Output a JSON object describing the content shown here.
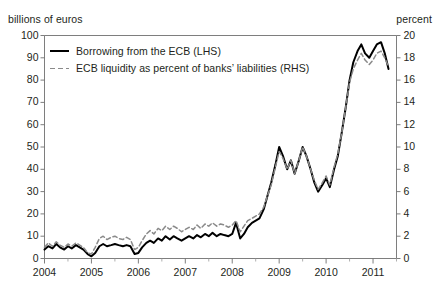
{
  "figure": {
    "clipped_title_fragment": "",
    "left_axis_unit": "billions of euros",
    "right_axis_unit": "percent"
  },
  "legend": {
    "items": [
      {
        "label": "Borrowing from the ECB (LHS)",
        "style": "solid",
        "color": "#000000"
      },
      {
        "label": "ECB liquidity as percent of banks’ liabilities (RHS)",
        "style": "dashed",
        "color": "#8a8a8a"
      }
    ]
  },
  "chart_data": {
    "type": "line",
    "title": "",
    "xlabel": "",
    "ylabel": "billions of euros",
    "y2label": "percent",
    "grid": false,
    "legend_position": "top-left inside",
    "xlim": [
      2004.0,
      2011.5
    ],
    "ylim": [
      0,
      100
    ],
    "y2lim": [
      0,
      20
    ],
    "yticks": [
      0,
      10,
      20,
      30,
      40,
      50,
      60,
      70,
      80,
      90,
      100
    ],
    "y2ticks": [
      0,
      2,
      4,
      6,
      8,
      10,
      12,
      14,
      16,
      18,
      20
    ],
    "xticks": [
      2004,
      2005,
      2006,
      2007,
      2008,
      2009,
      2010,
      2011
    ],
    "xtick_labels": [
      "2004",
      "2005",
      "2006",
      "2007",
      "2008",
      "2009",
      "2010",
      "2011"
    ],
    "x_minor_ticks_per_year": 2,
    "series": [
      {
        "name": "Borrowing from the ECB (LHS)",
        "axis": "left",
        "style": "solid",
        "color": "#000000",
        "x": [
          2004.0,
          2004.08,
          2004.17,
          2004.25,
          2004.33,
          2004.42,
          2004.5,
          2004.58,
          2004.67,
          2004.75,
          2004.83,
          2004.92,
          2005.0,
          2005.08,
          2005.17,
          2005.25,
          2005.33,
          2005.42,
          2005.5,
          2005.58,
          2005.67,
          2005.75,
          2005.83,
          2005.92,
          2006.0,
          2006.08,
          2006.17,
          2006.25,
          2006.33,
          2006.42,
          2006.5,
          2006.58,
          2006.67,
          2006.75,
          2006.83,
          2006.92,
          2007.0,
          2007.08,
          2007.17,
          2007.25,
          2007.33,
          2007.42,
          2007.5,
          2007.58,
          2007.67,
          2007.75,
          2007.83,
          2007.92,
          2008.0,
          2008.08,
          2008.17,
          2008.25,
          2008.33,
          2008.42,
          2008.5,
          2008.58,
          2008.67,
          2008.75,
          2008.83,
          2008.92,
          2009.0,
          2009.08,
          2009.17,
          2009.25,
          2009.33,
          2009.42,
          2009.5,
          2009.58,
          2009.67,
          2009.75,
          2009.83,
          2009.92,
          2010.0,
          2010.08,
          2010.17,
          2010.25,
          2010.33,
          2010.42,
          2010.5,
          2010.58,
          2010.67,
          2010.75,
          2010.83,
          2010.92,
          2011.0,
          2011.08,
          2011.17,
          2011.25,
          2011.33
        ],
        "values": [
          4.0,
          5.5,
          4.5,
          6.5,
          5.0,
          4.0,
          5.5,
          4.5,
          6.0,
          5.0,
          4.0,
          2.0,
          1.0,
          2.5,
          5.5,
          6.5,
          5.5,
          6.0,
          6.5,
          6.0,
          5.5,
          6.0,
          5.5,
          2.0,
          2.5,
          5.0,
          7.0,
          8.0,
          7.0,
          9.0,
          8.0,
          10.0,
          8.5,
          10.0,
          9.0,
          8.0,
          9.0,
          10.0,
          9.0,
          10.5,
          9.5,
          11.0,
          10.0,
          11.5,
          10.0,
          11.0,
          10.5,
          10.0,
          11.0,
          16.0,
          9.0,
          11.0,
          14.0,
          16.0,
          17.0,
          18.0,
          22.0,
          28.0,
          34.0,
          42.0,
          50.0,
          46.0,
          40.0,
          44.0,
          38.0,
          44.0,
          50.0,
          46.0,
          40.0,
          34.0,
          30.0,
          33.0,
          36.0,
          32.0,
          40.0,
          46.0,
          56.0,
          68.0,
          80.0,
          88.0,
          93.0,
          96.0,
          92.0,
          90.0,
          93.0,
          96.0,
          97.0,
          92.0,
          85.0
        ]
      },
      {
        "name": "ECB liquidity as percent of banks’ liabilities (RHS)",
        "axis": "right",
        "style": "dashed",
        "color": "#8a8a8a",
        "x": [
          2004.0,
          2004.08,
          2004.17,
          2004.25,
          2004.33,
          2004.42,
          2004.5,
          2004.58,
          2004.67,
          2004.75,
          2004.83,
          2004.92,
          2005.0,
          2005.08,
          2005.17,
          2005.25,
          2005.33,
          2005.42,
          2005.5,
          2005.58,
          2005.67,
          2005.75,
          2005.83,
          2005.92,
          2006.0,
          2006.08,
          2006.17,
          2006.25,
          2006.33,
          2006.42,
          2006.5,
          2006.58,
          2006.67,
          2006.75,
          2006.83,
          2006.92,
          2007.0,
          2007.08,
          2007.17,
          2007.25,
          2007.33,
          2007.42,
          2007.5,
          2007.58,
          2007.67,
          2007.75,
          2007.83,
          2007.92,
          2008.0,
          2008.08,
          2008.17,
          2008.25,
          2008.33,
          2008.42,
          2008.5,
          2008.58,
          2008.67,
          2008.75,
          2008.83,
          2008.92,
          2009.0,
          2009.08,
          2009.17,
          2009.25,
          2009.33,
          2009.42,
          2009.5,
          2009.58,
          2009.67,
          2009.75,
          2009.83,
          2009.92,
          2010.0,
          2010.08,
          2010.17,
          2010.25,
          2010.33,
          2010.42,
          2010.5,
          2010.58,
          2010.67,
          2010.75,
          2010.83,
          2010.92,
          2011.0,
          2011.08,
          2011.17,
          2011.25,
          2011.33
        ],
        "values": [
          1.0,
          1.4,
          1.1,
          1.5,
          1.2,
          1.0,
          1.3,
          1.1,
          1.4,
          1.2,
          1.0,
          0.5,
          0.4,
          1.0,
          1.8,
          2.0,
          1.7,
          1.9,
          2.0,
          1.8,
          1.7,
          1.9,
          1.7,
          0.8,
          1.0,
          1.6,
          2.2,
          2.5,
          2.2,
          2.7,
          2.5,
          2.9,
          2.6,
          2.9,
          2.7,
          2.4,
          2.6,
          2.8,
          2.6,
          3.0,
          2.7,
          3.1,
          2.9,
          3.2,
          2.9,
          3.1,
          3.0,
          2.8,
          3.0,
          3.4,
          2.4,
          2.9,
          3.4,
          3.6,
          3.8,
          4.0,
          4.6,
          5.6,
          6.6,
          8.2,
          9.6,
          9.0,
          8.0,
          8.8,
          7.6,
          8.8,
          10.0,
          9.2,
          8.0,
          7.0,
          6.2,
          6.8,
          7.4,
          6.6,
          8.2,
          9.4,
          11.2,
          13.6,
          15.8,
          17.0,
          17.8,
          18.4,
          17.8,
          17.4,
          17.8,
          18.4,
          18.6,
          18.0,
          17.2
        ]
      }
    ]
  }
}
